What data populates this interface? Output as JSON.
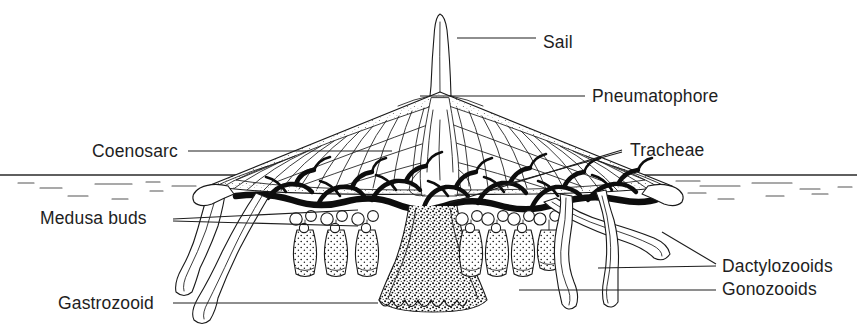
{
  "figure": {
    "organism": "Velella (Chondrophore / Siphonophore colony)",
    "view": "cutaway vertical section through float",
    "background_color": "#ffffff",
    "ink_color": "#1a1a1a",
    "label_color": "#1e1e1e"
  },
  "waterline": {
    "name": "sea surface",
    "y": 175,
    "x_start": 0,
    "x_end": 857,
    "color": "#2a2a2a"
  },
  "labels": [
    {
      "id": "sail",
      "text": "Sail",
      "side": "right",
      "text_x": 543,
      "text_y": 48,
      "leader": "M 457 38 L 536 38",
      "target": "thin erect vertical crest on top of float"
    },
    {
      "id": "pneumatophore",
      "text": "Pneumatophore",
      "side": "right",
      "text_x": 592,
      "text_y": 102,
      "leader": "M 420 96 L 585 96",
      "target": "gas-filled chambered float"
    },
    {
      "id": "coenosarc",
      "text": "Coenosarc",
      "side": "left",
      "text_x": 92,
      "text_y": 157,
      "leader": "M 188 151 L 392 151",
      "target": "dark branching tissue network below float"
    },
    {
      "id": "tracheae",
      "text": "Tracheae",
      "side": "right",
      "text_x": 630,
      "text_y": 156,
      "leader_1": "M 449 203 L 622 150",
      "leader_2": "M 500 185 L 622 152",
      "target": "air tubes entering float chambers"
    },
    {
      "id": "medusa-buds",
      "text": "Medusa buds",
      "side": "left",
      "text_x": 40,
      "text_y": 224,
      "leader_1": "M 173 219 L 356 212",
      "leader_2": "M 173 221 L 356 226",
      "target": "small spherical buds on gonozooid stalks"
    },
    {
      "id": "gastrozooid",
      "text": "Gastrozooid",
      "side": "left",
      "text_x": 58,
      "text_y": 309,
      "leader": "M 173 303 L 378 303",
      "target": "large central feeding polyp"
    },
    {
      "id": "dactylozooids",
      "text": "Dactylozooids",
      "side": "right",
      "text_x": 722,
      "text_y": 272,
      "leader_1": "M 598 268 L 716 266",
      "leader_2": "M 660 228 L 716 264",
      "target": "long marginal capture tentacles"
    },
    {
      "id": "gonozooids",
      "text": "Gonozooids",
      "side": "right",
      "text_x": 722,
      "text_y": 295,
      "leader": "M 519 290 L 716 290",
      "target": "flask-shaped reproductive polyps"
    }
  ],
  "anatomy": {
    "sail": {
      "name": "sail",
      "apex_x": 440,
      "apex_y": 14,
      "base_y": 96
    },
    "float": {
      "name": "pneumatophore-float",
      "apex_x": 440,
      "apex_y": 92,
      "left_x": 205,
      "right_x": 672,
      "base_y": 190,
      "chamber_count_left": 14,
      "chamber_count_right": 14
    },
    "gastrozooid": {
      "name": "gastrozooid",
      "center_x": 433,
      "top_y": 205,
      "bottom_y": 312,
      "texture": "dense stipple"
    },
    "gonozooids": {
      "name": "gonozooid-cluster",
      "count_left": 3,
      "count_right": 4,
      "left_positions": [
        305,
        336,
        367
      ],
      "right_positions": [
        471,
        497,
        523
      ],
      "top_y": 222,
      "bottom_y": 276
    },
    "dactylozooids": {
      "name": "dactylozooid-tentacles",
      "count_left": 2,
      "count_right": 3
    }
  }
}
